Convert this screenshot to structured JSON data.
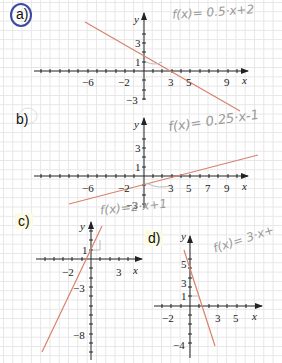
{
  "labels": {
    "a": "a)",
    "b": "b)",
    "c": "c)",
    "d": "d)"
  },
  "annotations": {
    "a": "f(x)= 0.5·x+2",
    "b": "f(x)= 0.25·x-1",
    "c": "f(x)=2·x+1",
    "d": "f(x)= 3·x+"
  },
  "axis_names": {
    "x": "x",
    "y": "y"
  },
  "graphs": {
    "a": {
      "x_ticks": [
        "-6",
        "-2",
        "3",
        "5",
        "9"
      ],
      "y_ticks": [
        "3",
        "1",
        "-3"
      ]
    },
    "b": {
      "x_ticks": [
        "-6",
        "-2",
        "3",
        "5",
        "7",
        "9"
      ],
      "y_ticks": [
        "3",
        "1",
        "-3"
      ]
    },
    "c": {
      "x_ticks": [
        "-2",
        "3"
      ],
      "y_ticks": [
        "1",
        "-3",
        "-8"
      ]
    },
    "d": {
      "x_ticks": [
        "-2",
        "3",
        "5"
      ],
      "y_ticks": [
        "5",
        "3",
        "1",
        "-4"
      ]
    }
  },
  "colors": {
    "line": "#d9826a",
    "axis": "#222222",
    "grid": "#e6e6e6",
    "annotation": "#9a9a9a",
    "circle": "#3b4aa0"
  }
}
